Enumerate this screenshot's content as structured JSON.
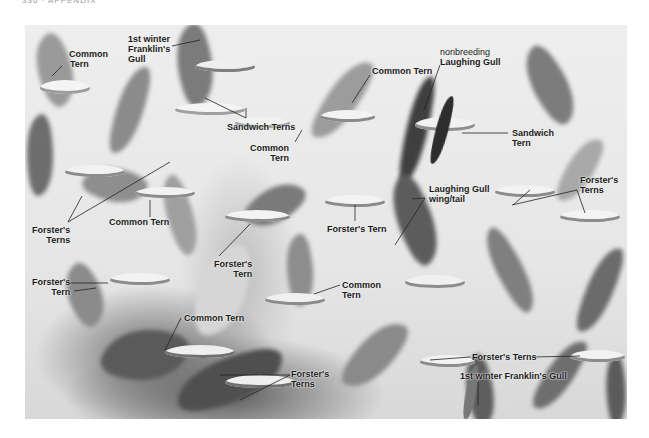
{
  "page": {
    "running_head": "336 · APPENDIX"
  },
  "photo": {
    "description": "Mixed flock of terns and gulls in flight, annotated",
    "colors": {
      "background": "#e8e8e8",
      "label_text": "#1b1b1b",
      "leader_line": "#222222"
    }
  },
  "labels": [
    {
      "id": "common-tern-1",
      "lines": [
        "Common",
        "Tern"
      ]
    },
    {
      "id": "franklins-gull-1",
      "lines": [
        "1st winter",
        "Franklin's",
        "Gull"
      ]
    },
    {
      "id": "sandwich-terns-1",
      "lines": [
        "Sandwich Terns"
      ]
    },
    {
      "id": "common-tern-2",
      "lines": [
        "Common Tern"
      ]
    },
    {
      "id": "laughing-gull-nonbreeding",
      "lines": [
        "nonbreeding",
        "Laughing Gull"
      ]
    },
    {
      "id": "sandwich-tern-2",
      "lines": [
        "Sandwich",
        "Tern"
      ]
    },
    {
      "id": "common-tern-3",
      "lines": [
        "Common",
        "Tern"
      ]
    },
    {
      "id": "forsters-terns-1",
      "lines": [
        "Forster's",
        "Terns"
      ]
    },
    {
      "id": "common-tern-4",
      "lines": [
        "Common Tern"
      ]
    },
    {
      "id": "forsters-tern-1",
      "lines": [
        "Forster's Tern"
      ]
    },
    {
      "id": "laughing-gull-wingtail",
      "lines": [
        "Laughing Gull",
        "wing/tail"
      ]
    },
    {
      "id": "forsters-terns-2",
      "lines": [
        "Forster's",
        "Terns"
      ]
    },
    {
      "id": "forsters-tern-2",
      "lines": [
        "Forster's",
        "Tern"
      ]
    },
    {
      "id": "forsters-tern-3",
      "lines": [
        "Forster's",
        "Tern"
      ]
    },
    {
      "id": "common-tern-5",
      "lines": [
        "Common",
        "Tern"
      ]
    },
    {
      "id": "common-tern-6",
      "lines": [
        "Common Tern"
      ]
    },
    {
      "id": "forsters-terns-3",
      "lines": [
        "Forster's",
        "Terns"
      ]
    },
    {
      "id": "forsters-terns-4",
      "lines": [
        "Forster's Terns"
      ]
    },
    {
      "id": "franklins-gull-2",
      "lines": [
        "1st winter Franklin's Gull"
      ]
    }
  ]
}
